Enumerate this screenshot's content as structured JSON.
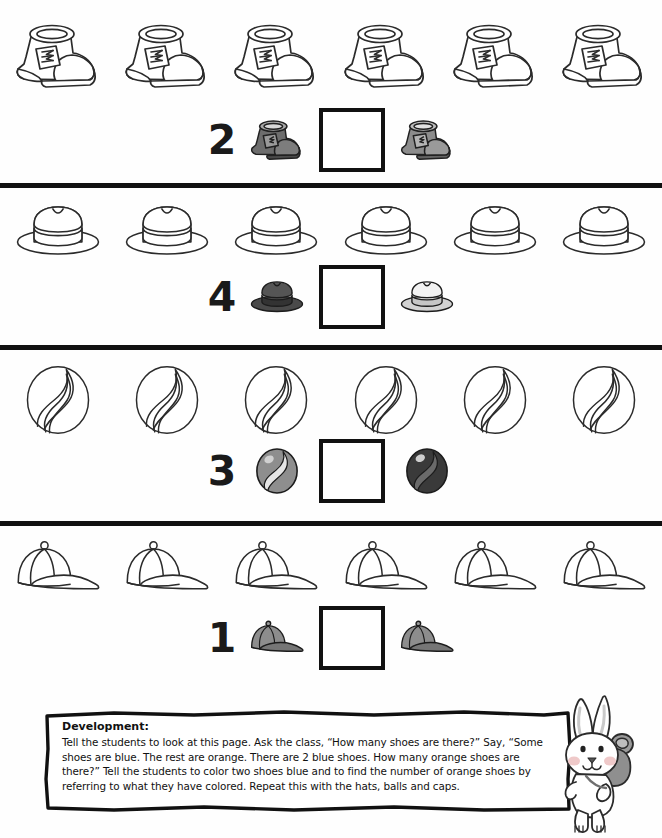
{
  "page": {
    "type": "math-worksheet",
    "width": 662,
    "height": 838,
    "background": "#ffffff",
    "ink_color": "#111111"
  },
  "rows": [
    {
      "id": "shoes",
      "object_name": "shoe",
      "object_icon": "shoe-outline-icon",
      "count": 6,
      "equation": {
        "number": "2",
        "left_icon": "shoe-dark-icon",
        "left_icon_color": "#6d6d6d",
        "right_icon": "shoe-gray-icon",
        "right_icon_color": "#8c8c8c",
        "answer_box_value": ""
      }
    },
    {
      "id": "hats",
      "object_name": "hat",
      "object_icon": "fedora-outline-icon",
      "count": 6,
      "equation": {
        "number": "4",
        "left_icon": "fedora-dark-icon",
        "left_icon_color": "#3f3f3f",
        "right_icon": "fedora-light-icon",
        "right_icon_color": "#e8e8e8",
        "answer_box_value": ""
      }
    },
    {
      "id": "balls",
      "object_name": "ball",
      "object_icon": "ball-outline-icon",
      "count": 6,
      "equation": {
        "number": "3",
        "left_icon": "ball-gray-icon",
        "left_icon_color": "#8e8e8e",
        "right_icon": "ball-dark-icon",
        "right_icon_color": "#3a3a3a",
        "answer_box_value": ""
      }
    },
    {
      "id": "caps",
      "object_name": "cap",
      "object_icon": "cap-outline-icon",
      "count": 6,
      "equation": {
        "number": "1",
        "left_icon": "cap-gray-icon",
        "left_icon_color": "#808080",
        "right_icon": "cap-gray-icon",
        "right_icon_color": "#808080",
        "answer_box_value": ""
      }
    }
  ],
  "development": {
    "title": "Development:",
    "body": "Tell the students to look at this page. Ask the class, “How many shoes are there?” Say, “Some shoes are blue. The rest are orange. There are 2 blue shoes. How many orange shoes are there?” Tell the students to color two shoes blue and to find the number of orange shoes by referring to what they have colored. Repeat this with the hats, balls and caps."
  },
  "mascot": {
    "name": "bunny-with-backpack",
    "body_color": "#ffffff",
    "cheek_color": "#efc9c9",
    "backpack_color": "#8a8a8a"
  }
}
